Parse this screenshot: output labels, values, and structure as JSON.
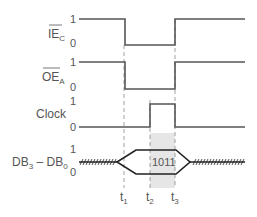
{
  "diagram": {
    "type": "timing-diagram",
    "signals": [
      {
        "name": "IE",
        "subscript": "C",
        "overbar": true,
        "high_label": "1",
        "low_label": "0"
      },
      {
        "name": "OE",
        "subscript": "A",
        "overbar": true,
        "high_label": "1",
        "low_label": "0"
      },
      {
        "name": "Clock",
        "subscript": "",
        "overbar": false,
        "high_label": "1",
        "low_label": "0"
      },
      {
        "name": "DB",
        "range_label": "DB",
        "sub_hi": "3",
        "dash": " – ",
        "sub_lo": "0",
        "high_label": "1",
        "low_label": "0"
      }
    ],
    "data_value": "1011",
    "time_markers": [
      {
        "label": "t",
        "sub": "1"
      },
      {
        "label": "t",
        "sub": "2"
      },
      {
        "label": "t",
        "sub": "3"
      }
    ],
    "colors": {
      "line": "#555555",
      "bus": "#222222",
      "shade": "#e6e6e6"
    }
  }
}
